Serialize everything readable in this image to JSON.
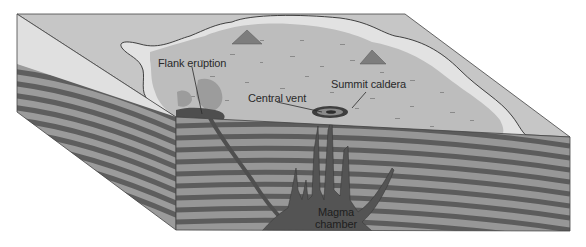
{
  "diagram": {
    "labels": {
      "flank_eruption": "Flank eruption",
      "central_vent": "Central vent",
      "summit_caldera": "Summit caldera",
      "magma_line1": "Magma",
      "magma_line2": "chamber"
    },
    "colors": {
      "background": "#ffffff",
      "top_outer": "#c4c4c4",
      "top_light_band": "#e2e2e2",
      "top_lava_field": "#b9b9b9",
      "strata_light": "#9a9a9a",
      "strata_dark": "#5d5d5d",
      "magma": "#555555",
      "flank_flow": "#6e6e6e",
      "outline": "#3a3a3a",
      "text": "#2a2a2a"
    }
  }
}
